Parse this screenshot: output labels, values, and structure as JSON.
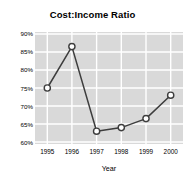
{
  "chart_data": {
    "type": "line",
    "title": "Cost:Income Ratio",
    "xlabel": "Year",
    "ylabel": "",
    "categories": [
      "1995",
      "1996",
      "1997",
      "1998",
      "1999",
      "2000"
    ],
    "values": [
      75,
      86.5,
      63,
      64,
      66.5,
      73
    ],
    "series": [
      {
        "name": "Cost:Income Ratio",
        "values": [
          75,
          86.5,
          63,
          64,
          66.5,
          73
        ]
      }
    ],
    "ylim": [
      60,
      90
    ],
    "yticks": [
      90,
      85,
      80,
      75,
      70,
      65,
      60
    ],
    "ytick_labels": [
      "90%",
      "85%",
      "80%",
      "75%",
      "70%",
      "65%",
      "60%"
    ],
    "xtick_labels": [
      "1995",
      "1996",
      "1997",
      "1998",
      "1999",
      "2000"
    ],
    "grid": true,
    "legend": "none",
    "marker": "circle-open",
    "colors": {
      "plot_background": "#d9d9d9",
      "gridline": "#ffffff",
      "line": "#3d3d3d",
      "marker_fill": "#ffffff",
      "marker_edge": "#3d3d3d",
      "text": "#000000",
      "figure_background": "#ffffff"
    }
  }
}
